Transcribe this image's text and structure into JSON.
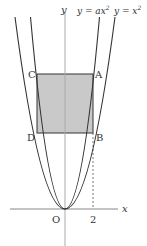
{
  "diagram": {
    "axis_labels": {
      "x": "x",
      "y": "y",
      "origin": "O"
    },
    "curves": [
      {
        "label": "y = ax²",
        "equation_lhs": "y = ",
        "equation_rhs": "ax",
        "exp": "2"
      },
      {
        "label": "y = x²",
        "equation_lhs": "y = ",
        "equation_rhs": "x",
        "exp": "2"
      }
    ],
    "points": {
      "A": "A",
      "B": "B",
      "C": "C",
      "D": "D"
    },
    "tick": "2",
    "colors": {
      "shade": "#c8c8c8",
      "line": "#333333",
      "axis": "#999999"
    }
  }
}
